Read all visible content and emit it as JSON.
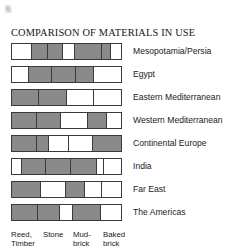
{
  "figure": {
    "title": "COMPARISON OF MATERIALS IN USE",
    "artifact_name": "scan-speck"
  },
  "chart_data": {
    "type": "bar",
    "orientation": "horizontal",
    "subtype": "segmented-proportional-bar",
    "title": "COMPARISON OF MATERIALS IN USE",
    "xlabel": "",
    "ylabel": "",
    "grid": false,
    "legend_position": "bottom",
    "fill_color": "#8a8a8a",
    "empty_color": "#ffffff",
    "outline_color": "#3a3a3a",
    "categories": [
      "Reed, Timber",
      "Stone",
      "Mud-brick",
      "Baked brick"
    ],
    "legend_labels": [
      "Reed,\nTimber",
      "Stone",
      "Mud-\nbrick",
      "Baked\nbrick"
    ],
    "regions": [
      "Mesopotamia/Persia",
      "Egypt",
      "Eastern Mediterranean",
      "Western Mediterranean",
      "Continental Europe",
      "India",
      "Far East",
      "The Americas"
    ],
    "note": "Each row is one region; the bar is split into sub-cells whose shading (filled = material in use, blank = not in use) spans the four material columns listed in the legend.",
    "rows": [
      {
        "region": "Mesopotamia/Persia",
        "segments": [
          {
            "width_pct": 18,
            "state": "empty"
          },
          {
            "width_pct": 15,
            "state": "fill"
          },
          {
            "width_pct": 14,
            "state": "fill"
          },
          {
            "width_pct": 11,
            "state": "empty"
          },
          {
            "width_pct": 25,
            "state": "fill"
          },
          {
            "width_pct": 8,
            "state": "fill"
          },
          {
            "width_pct": 9,
            "state": "empty"
          }
        ],
        "values": [
          0,
          1,
          1,
          0,
          1,
          1,
          0
        ]
      },
      {
        "region": "Egypt",
        "segments": [
          {
            "width_pct": 16,
            "state": "empty"
          },
          {
            "width_pct": 21,
            "state": "fill"
          },
          {
            "width_pct": 22,
            "state": "fill"
          },
          {
            "width_pct": 16,
            "state": "fill"
          },
          {
            "width_pct": 25,
            "state": "empty"
          }
        ],
        "values": [
          0,
          1,
          1,
          1,
          0
        ]
      },
      {
        "region": "Eastern Mediterranean",
        "segments": [
          {
            "width_pct": 25,
            "state": "fill"
          },
          {
            "width_pct": 25,
            "state": "fill"
          },
          {
            "width_pct": 25,
            "state": "empty"
          },
          {
            "width_pct": 25,
            "state": "empty"
          }
        ],
        "values": [
          1,
          1,
          0,
          0
        ]
      },
      {
        "region": "Western Mediterranean",
        "segments": [
          {
            "width_pct": 23,
            "state": "fill"
          },
          {
            "width_pct": 22,
            "state": "fill"
          },
          {
            "width_pct": 25,
            "state": "empty"
          },
          {
            "width_pct": 17,
            "state": "fill"
          },
          {
            "width_pct": 13,
            "state": "empty"
          }
        ],
        "values": [
          1,
          1,
          0,
          1,
          0
        ]
      },
      {
        "region": "Continental Europe",
        "segments": [
          {
            "width_pct": 23,
            "state": "fill"
          },
          {
            "width_pct": 11,
            "state": "fill"
          },
          {
            "width_pct": 18,
            "state": "empty"
          },
          {
            "width_pct": 22,
            "state": "empty"
          },
          {
            "width_pct": 26,
            "state": "fill"
          }
        ],
        "values": [
          1,
          1,
          0,
          0,
          1
        ]
      },
      {
        "region": "India",
        "segments": [
          {
            "width_pct": 9,
            "state": "empty"
          },
          {
            "width_pct": 22,
            "state": "fill"
          },
          {
            "width_pct": 23,
            "state": "fill"
          },
          {
            "width_pct": 24,
            "state": "fill"
          },
          {
            "width_pct": 6,
            "state": "empty"
          },
          {
            "width_pct": 16,
            "state": "empty"
          }
        ],
        "values": [
          0,
          1,
          1,
          1,
          0,
          0
        ]
      },
      {
        "region": "Far East",
        "segments": [
          {
            "width_pct": 27,
            "state": "fill"
          },
          {
            "width_pct": 23,
            "state": "empty"
          },
          {
            "width_pct": 17,
            "state": "fill"
          },
          {
            "width_pct": 16,
            "state": "empty"
          },
          {
            "width_pct": 17,
            "state": "empty"
          }
        ],
        "values": [
          1,
          0,
          1,
          0,
          0
        ]
      },
      {
        "region": "The Americas",
        "segments": [
          {
            "width_pct": 24,
            "state": "fill"
          },
          {
            "width_pct": 20,
            "state": "fill"
          },
          {
            "width_pct": 12,
            "state": "empty"
          },
          {
            "width_pct": 26,
            "state": "fill"
          },
          {
            "width_pct": 18,
            "state": "empty"
          }
        ],
        "values": [
          1,
          1,
          0,
          1,
          0
        ]
      }
    ]
  }
}
